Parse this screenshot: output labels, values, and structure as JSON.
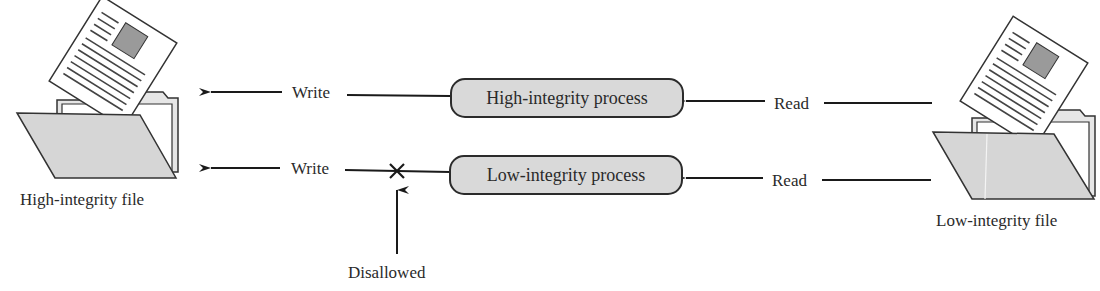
{
  "diagram": {
    "type": "integrity-policy-flow",
    "files": {
      "high": {
        "label": "High-integrity file"
      },
      "low": {
        "label": "Low-integrity file"
      }
    },
    "processes": {
      "high": {
        "label": "High-integrity process"
      },
      "low": {
        "label": "Low-integrity process"
      }
    },
    "edges": {
      "high_write": {
        "label": "Write",
        "from": "High-integrity process",
        "to": "High-integrity file",
        "allowed": true
      },
      "high_read": {
        "label": "Read",
        "from": "Low-integrity file",
        "to": "High-integrity process",
        "allowed": true
      },
      "low_write": {
        "label": "Write",
        "from": "Low-integrity process",
        "to": "High-integrity file",
        "allowed": false
      },
      "low_read": {
        "label": "Read",
        "from": "Low-integrity file",
        "to": "Low-integrity process",
        "allowed": true
      }
    },
    "annotation": {
      "label": "Disallowed",
      "symbol": "×"
    },
    "colors": {
      "line": "#1a1a1a",
      "process_fill": "#d9d9d9",
      "folder_fill": "#d6d6d6",
      "doc_fill": "#ffffff",
      "doc_image": "#9a9a9a"
    }
  }
}
